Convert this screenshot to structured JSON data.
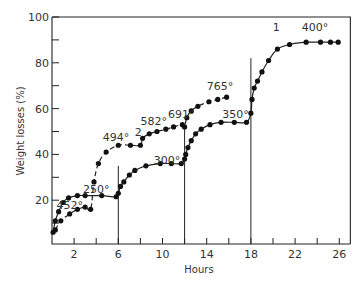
{
  "chart_data": {
    "type": "line",
    "title": "",
    "xlabel": "Hours",
    "ylabel": "Weight losses (%)",
    "xlim": [
      0,
      27
    ],
    "ylim": [
      0,
      100
    ],
    "x_ticks": [
      2,
      4,
      6,
      8,
      10,
      12,
      14,
      16,
      18,
      20,
      22,
      24,
      26
    ],
    "x_tick_labels": [
      "2",
      "6",
      "10",
      "14",
      "18",
      "22",
      "26"
    ],
    "x_tick_label_values": [
      2,
      6,
      10,
      14,
      18,
      22,
      26
    ],
    "y_ticks": [
      10,
      20,
      30,
      40,
      50,
      60,
      70,
      80,
      90,
      100
    ],
    "y_tick_labels": [
      "20",
      "40",
      "60",
      "80",
      "100"
    ],
    "y_tick_label_values": [
      20,
      40,
      60,
      80,
      100
    ],
    "grid": false,
    "legend": "none (curves labelled inline 1 and 2)",
    "vertical_lines": [
      {
        "x": 6,
        "y_top": 35
      },
      {
        "x": 12,
        "y_top": 51
      },
      {
        "x": 18,
        "y_top": 82
      }
    ],
    "series": [
      {
        "name": "1",
        "style": "solid",
        "label_position": {
          "x": 20.3,
          "y": 93
        },
        "x": [
          0.1,
          0.3,
          0.6,
          1.0,
          1.5,
          2.3,
          3.0,
          4.5,
          5.8,
          6.0,
          6.2,
          6.5,
          7.0,
          7.5,
          8.5,
          9.8,
          10.8,
          11.7,
          12.0,
          12.1,
          12.3,
          12.6,
          13.0,
          13.5,
          14.3,
          15.3,
          16.5,
          17.6,
          18.0,
          18.1,
          18.3,
          18.6,
          19.0,
          19.6,
          20.4,
          21.5,
          23.0,
          24.3,
          25.2,
          25.9
        ],
        "y": [
          6,
          11,
          15,
          19,
          21,
          22,
          22,
          22,
          21.5,
          23,
          26,
          28,
          31,
          33,
          35,
          36,
          36,
          36,
          38,
          40,
          43,
          46,
          49,
          51,
          53,
          54,
          54,
          54,
          58,
          64,
          69,
          72,
          76,
          81,
          86,
          88,
          89,
          89,
          89,
          89
        ]
      },
      {
        "name": "2",
        "style": "dashed",
        "label_position": {
          "x": 8.2,
          "y": 48
        },
        "x": [
          0.3,
          0.8,
          1.6,
          2.3,
          3.0,
          3.5,
          3.8,
          4.2,
          4.9,
          6.0,
          7.1,
          8.0,
          8.2,
          8.8,
          9.5,
          10.3,
          11.0,
          11.8,
          12.0,
          12.2,
          12.6,
          13.2,
          14.2,
          15.0,
          15.8
        ],
        "y": [
          7,
          11,
          14,
          16,
          17,
          16,
          28,
          36,
          41,
          44,
          44,
          44,
          47,
          49,
          50,
          51,
          52,
          53,
          52,
          56,
          59,
          61,
          63,
          64,
          65
        ]
      }
    ],
    "annotations": [
      {
        "text": "400°",
        "x": 23.8,
        "y": 94
      },
      {
        "text": "1",
        "x": 20.3,
        "y": 94
      },
      {
        "text": "765°",
        "x": 15.2,
        "y": 68
      },
      {
        "text": "691°",
        "x": 11.7,
        "y": 56
      },
      {
        "text": "582°",
        "x": 9.2,
        "y": 53
      },
      {
        "text": "2",
        "x": 7.8,
        "y": 48
      },
      {
        "text": "494°",
        "x": 5.8,
        "y": 46
      },
      {
        "text": "350°",
        "x": 16.6,
        "y": 56
      },
      {
        "text": "300°",
        "x": 10.4,
        "y": 36
      },
      {
        "text": "250°",
        "x": 4.0,
        "y": 23
      },
      {
        "text": "452°",
        "x": 1.6,
        "y": 16
      }
    ]
  }
}
